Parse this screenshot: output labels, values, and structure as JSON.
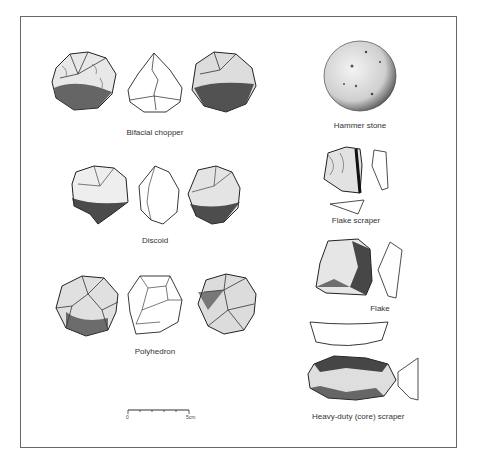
{
  "figure": {
    "artifacts": [
      {
        "id": "bifacial-chopper",
        "label": "Bifacial chopper"
      },
      {
        "id": "discoid",
        "label": "Discoid"
      },
      {
        "id": "polyhedron",
        "label": "Polyhedron"
      },
      {
        "id": "hammer-stone",
        "label": "Hammer stone"
      },
      {
        "id": "flake-scraper",
        "label": "Flake scraper"
      },
      {
        "id": "flake",
        "label": "Flake"
      },
      {
        "id": "heavy-duty-scraper",
        "label": "Heavy-duty (core) scraper"
      }
    ],
    "scale_bar": {
      "start_label": "0",
      "end_label": "5cm",
      "ticks": 5
    }
  },
  "colors": {
    "ink": "#222222",
    "frame": "#666666",
    "background": "#ffffff"
  }
}
